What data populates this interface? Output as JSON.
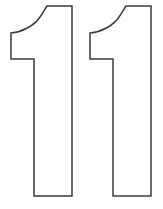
{
  "image": {
    "title": "Number 1 Stencil Outline",
    "description": "Two identical outlined numeral one shapes side by side",
    "background_color": "#ffffff",
    "stroke_color": "#3a3a3a",
    "fill_color": "#ffffff",
    "stroke_width": 1.5,
    "width": 163,
    "height": 209
  },
  "digits": [
    {
      "name": "digit-one-left",
      "character": "1",
      "position": "left",
      "x_offset": 0,
      "path": "M 47 6 L 72 6 L 72 196 L 34 196 L 34 59 L 11 59 L 11 33 C 22 32 34 26 40 17 C 43 13 45 9 47 6 Z"
    },
    {
      "name": "digit-one-right",
      "character": "1",
      "position": "right",
      "x_offset": 79,
      "path": "M 126 6 L 151 6 L 151 196 L 113 196 L 113 59 L 90 59 L 90 33 C 101 32 113 26 119 17 C 122 13 124 9 126 6 Z"
    }
  ]
}
